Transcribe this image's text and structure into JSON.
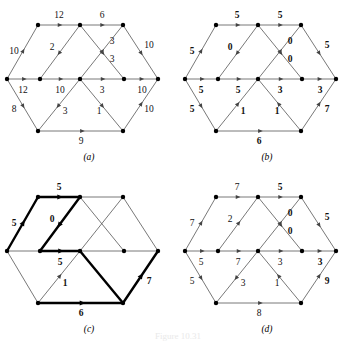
{
  "figure": {
    "caption": "Figure 10.31",
    "panel_captions": [
      "(a)",
      "(b)",
      "(c)",
      "(d)"
    ]
  },
  "chart_data": {
    "type": "diagram",
    "title": "Figure 10.31",
    "subtype": "network-flow-graph",
    "nodes": [
      {
        "id": "s",
        "x": 7,
        "y": 79
      },
      {
        "id": "t1",
        "x": 38,
        "y": 25
      },
      {
        "id": "t2",
        "x": 80,
        "y": 25
      },
      {
        "id": "t3",
        "x": 123,
        "y": 25
      },
      {
        "id": "m1",
        "x": 40,
        "y": 79
      },
      {
        "id": "m2",
        "x": 80,
        "y": 79
      },
      {
        "id": "m3",
        "x": 124,
        "y": 79
      },
      {
        "id": "e",
        "x": 158,
        "y": 79
      },
      {
        "id": "b1",
        "x": 38,
        "y": 131
      },
      {
        "id": "b2",
        "x": 123,
        "y": 131
      }
    ],
    "edges": [
      {
        "id": "s-t1",
        "from": "s",
        "to": "t1",
        "label_pos": {
          "x": 14,
          "y": 52
        },
        "name": "left-upper"
      },
      {
        "id": "t1-t2",
        "from": "t1",
        "to": "t2",
        "label_pos": {
          "x": 59,
          "y": 16
        },
        "name": "top-left"
      },
      {
        "id": "t2-t3",
        "from": "t2",
        "to": "t3",
        "label_pos": {
          "x": 102,
          "y": 16
        },
        "name": "top-right"
      },
      {
        "id": "t2-m1",
        "from": "t2",
        "to": "m1",
        "label_pos": {
          "x": 52,
          "y": 48
        },
        "name": "diag-t2-m1"
      },
      {
        "id": "m2-t3",
        "from": "m2",
        "to": "t3",
        "label_pos": {
          "x": 112,
          "y": 42
        },
        "name": "diag-m2-t3"
      },
      {
        "id": "t2-m3",
        "from": "t2",
        "to": "m3",
        "label_pos": {
          "x": 112,
          "y": 60
        },
        "name": "diag-t2-m3"
      },
      {
        "id": "t3-e",
        "from": "t3",
        "to": "e",
        "label_pos": {
          "x": 149,
          "y": 46
        },
        "name": "right-upper"
      },
      {
        "id": "s-m1",
        "from": "s",
        "to": "m1",
        "label_pos": {
          "x": 23,
          "y": 91
        },
        "name": "mid-1"
      },
      {
        "id": "m1-m2",
        "from": "m1",
        "to": "m2",
        "label_pos": {
          "x": 60,
          "y": 91
        },
        "name": "mid-2"
      },
      {
        "id": "m2-m3",
        "from": "m2",
        "to": "m3",
        "label_pos": {
          "x": 102,
          "y": 91
        },
        "name": "mid-3"
      },
      {
        "id": "m3-e",
        "from": "m3",
        "to": "e",
        "label_pos": {
          "x": 142,
          "y": 91
        },
        "name": "mid-4"
      },
      {
        "id": "s-b1",
        "from": "s",
        "to": "b1",
        "label_pos": {
          "x": 14,
          "y": 110
        },
        "name": "left-lower"
      },
      {
        "id": "b1-m2",
        "from": "b1",
        "to": "m2",
        "label_pos": {
          "x": 65,
          "y": 112
        },
        "name": "diag-b1-m2"
      },
      {
        "id": "m2-b2",
        "from": "m2",
        "to": "b2",
        "label_pos": {
          "x": 99,
          "y": 112
        },
        "name": "diag-m2-b2"
      },
      {
        "id": "b1-b2",
        "from": "b1",
        "to": "b2",
        "label_pos": {
          "x": 81,
          "y": 142
        },
        "name": "bottom"
      },
      {
        "id": "b2-e",
        "from": "b2",
        "to": "e",
        "label_pos": {
          "x": 149,
          "y": 110
        },
        "name": "right-lower"
      }
    ],
    "panels": [
      {
        "id": "a",
        "caption": "(a)",
        "bold_labels": false,
        "highlight": [],
        "edge_values": {
          "s-t1": "10",
          "t1-t2": "12",
          "t2-t3": "6",
          "t2-m1": "2",
          "m2-t3": "3",
          "t2-m3": "3",
          "t3-e": "10",
          "s-m1": "12",
          "m1-m2": "10",
          "m2-m3": "3",
          "m3-e": "10",
          "s-b1": "8",
          "b1-m2": "3",
          "m2-b2": "1",
          "b1-b2": "9",
          "b2-e": "10"
        },
        "edge_directions": {
          "s-t1": "forward",
          "t1-t2": "forward",
          "t2-t3": "forward",
          "t2-m1": "forward",
          "m2-t3": "forward",
          "t2-m3": "forward",
          "t3-e": "forward",
          "s-m1": "forward",
          "m1-m2": "forward",
          "m2-m3": "forward",
          "m3-e": "forward",
          "s-b1": "forward",
          "b1-m2": "reverse",
          "m2-b2": "forward",
          "b1-b2": "forward",
          "b2-e": "forward"
        }
      },
      {
        "id": "b",
        "caption": "(b)",
        "bold_labels": true,
        "highlight": [],
        "edge_values": {
          "s-t1": "5",
          "t1-t2": "5",
          "t2-t3": "5",
          "t2-m1": "0",
          "m2-t3": "0",
          "t2-m3": "0",
          "t3-e": "5",
          "s-m1": "5",
          "m1-m2": "5",
          "m2-m3": "3",
          "m3-e": "3",
          "s-b1": "5",
          "b1-m2": "1",
          "m2-b2": "1",
          "b1-b2": "6",
          "b2-e": "7"
        },
        "edge_directions": {
          "s-t1": "forward",
          "t1-t2": "forward",
          "t2-t3": "forward",
          "t2-m1": "forward",
          "m2-t3": "forward",
          "t2-m3": "forward",
          "t3-e": "forward",
          "s-m1": "forward",
          "m1-m2": "forward",
          "m2-m3": "forward",
          "m3-e": "forward",
          "s-b1": "forward",
          "b1-m2": "forward",
          "m2-b2": "reverse",
          "b1-b2": "forward",
          "b2-e": "forward"
        }
      },
      {
        "id": "c",
        "caption": "(c)",
        "bold_labels": true,
        "highlight": [
          "s-t1",
          "t1-t2",
          "t2-m1",
          "m1-m2",
          "m2-b2",
          "b1-b2",
          "b2-e"
        ],
        "edge_values": {
          "s-t1": "5",
          "t1-t2": "5",
          "t2-t3": "",
          "t2-m1": "0",
          "m2-t3": "",
          "t2-m3": "",
          "t3-e": "",
          "s-m1": "",
          "m1-m2": "5",
          "m2-m3": "",
          "m3-e": "",
          "s-b1": "",
          "b1-m2": "1",
          "m2-b2": "",
          "b1-b2": "6",
          "b2-e": "7"
        },
        "edge_directions": {
          "s-t1": "forward",
          "t1-t2": "forward",
          "t2-t3": "forward",
          "t2-m1": "forward",
          "m2-t3": "forward",
          "t2-m3": "forward",
          "t3-e": "forward",
          "s-m1": "forward",
          "m1-m2": "forward",
          "m2-m3": "forward",
          "m3-e": "forward",
          "s-b1": "forward",
          "b1-m2": "forward",
          "m2-b2": "forward",
          "b1-b2": "forward",
          "b2-e": "forward"
        },
        "label_overrides": {
          "b1-m2": {
            "x": 65,
            "y": 112,
            "bold": true
          }
        }
      },
      {
        "id": "d",
        "caption": "(d)",
        "bold_labels": false,
        "highlight": [],
        "edge_values": {
          "s-t1": "7",
          "t1-t2": "7",
          "t2-t3": "5",
          "t2-m1": "2",
          "m2-t3": "0",
          "t2-m3": "0",
          "t3-e": "5",
          "s-m1": "5",
          "m1-m2": "7",
          "m2-m3": "3",
          "m3-e": "3",
          "s-b1": "5",
          "b1-m2": "3",
          "m2-b2": "1",
          "b1-b2": "8",
          "b2-e": "9"
        },
        "bold_map": {
          "t2-t3": true,
          "m2-t3": true,
          "t2-m3": true,
          "t3-e": true,
          "m3-e": true,
          "b2-e": true
        },
        "edge_directions": {
          "s-t1": "forward",
          "t1-t2": "forward",
          "t2-t3": "forward",
          "t2-m1": "reverse",
          "m2-t3": "forward",
          "t2-m3": "forward",
          "t3-e": "forward",
          "s-m1": "forward",
          "m1-m2": "forward",
          "m2-m3": "forward",
          "m3-e": "forward",
          "s-b1": "forward",
          "b1-m2": "reverse",
          "m2-b2": "reverse",
          "b1-b2": "forward",
          "b2-e": "forward"
        }
      }
    ]
  }
}
